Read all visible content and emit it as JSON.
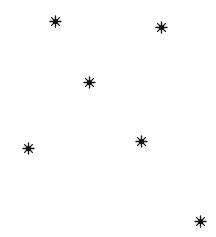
{
  "canvas": {
    "width": 216,
    "height": 237,
    "background": "#ffffff"
  },
  "marker": {
    "shape": "eight-point-star",
    "color": "#111111",
    "size": 11
  },
  "stars": [
    {
      "x": 55,
      "y": 21
    },
    {
      "x": 161,
      "y": 27
    },
    {
      "x": 89,
      "y": 82
    },
    {
      "x": 28,
      "y": 148
    },
    {
      "x": 141,
      "y": 141
    },
    {
      "x": 200,
      "y": 221
    }
  ]
}
